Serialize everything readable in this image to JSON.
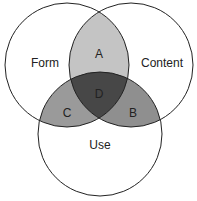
{
  "diagram": {
    "type": "venn-3",
    "sets": [
      {
        "id": "form",
        "label": "Form"
      },
      {
        "id": "content",
        "label": "Content"
      },
      {
        "id": "use",
        "label": "Use"
      }
    ],
    "regions": [
      {
        "id": "A",
        "label": "A",
        "sets": [
          "form",
          "content"
        ],
        "color": "#c4c4c4"
      },
      {
        "id": "B",
        "label": "B",
        "sets": [
          "content",
          "use"
        ],
        "color": "#8f8f8f"
      },
      {
        "id": "C",
        "label": "C",
        "sets": [
          "form",
          "use"
        ],
        "color": "#9a9a9a"
      },
      {
        "id": "D",
        "label": "D",
        "sets": [
          "form",
          "content",
          "use"
        ],
        "color": "#474747"
      }
    ],
    "stroke_color": "#222222",
    "background": "#ffffff"
  }
}
